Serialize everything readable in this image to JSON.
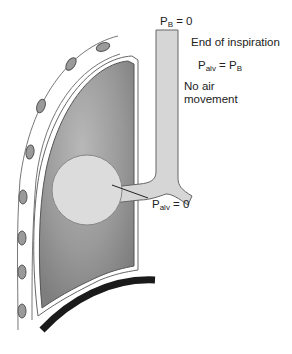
{
  "labels": {
    "p_b": {
      "symbol": "P",
      "subscript": "B",
      "eq": " = 0"
    },
    "end_of_inspiration": "End of inspiration",
    "relation": {
      "left": "P",
      "left_sub": "alv",
      "eq": " = ",
      "right": "P",
      "right_sub": "B"
    },
    "no_air_line1": "No air",
    "no_air_line2": "movement",
    "p_alv": {
      "symbol": "P",
      "subscript": "alv",
      "eq": " = 0"
    }
  },
  "colors": {
    "lung": "#8e8e8e",
    "lung_highlight": "#b4b4b4",
    "airway": "#d6d6d6",
    "alveolus": "#dcdcdc",
    "rib": "#9a9a9a",
    "diaphragm": "#1a1a1a",
    "outline": "#555555"
  }
}
